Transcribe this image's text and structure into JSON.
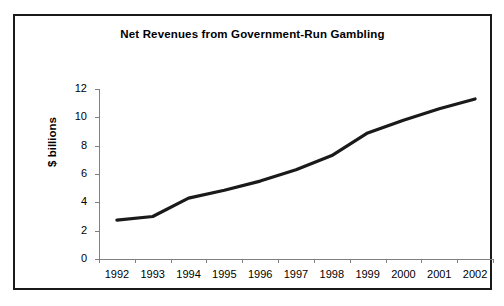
{
  "chart_data": {
    "type": "line",
    "title": "Net Revenues from Government-Run Gambling",
    "xlabel": "",
    "ylabel": "$ billions",
    "categories": [
      "1992",
      "1993",
      "1994",
      "1995",
      "1996",
      "1997",
      "1998",
      "1999",
      "2000",
      "2001",
      "2002"
    ],
    "values": [
      2.75,
      3.0,
      4.3,
      4.85,
      5.5,
      6.3,
      7.3,
      8.9,
      9.8,
      10.6,
      11.3
    ],
    "series": [
      {
        "name": "Net Revenues",
        "values": [
          2.75,
          3.0,
          4.3,
          4.85,
          5.5,
          6.3,
          7.3,
          8.9,
          9.8,
          10.6,
          11.3
        ]
      }
    ],
    "ylim": [
      0,
      12
    ],
    "yticks": [
      0,
      2,
      4,
      6,
      8,
      10,
      12
    ],
    "ytick_labels": [
      "0",
      "2",
      "4",
      "6",
      "8",
      "10",
      "12"
    ],
    "grid": false,
    "legend": false,
    "legend_position": "none",
    "line_color": "#1a1a1a",
    "axis_color": "#808080",
    "background_color": "#ffffff",
    "border_color": "#1a1a1a"
  },
  "figure": {
    "title": "Net Revenues from Government-Run Gambling",
    "y_axis_title": "$ billions"
  }
}
